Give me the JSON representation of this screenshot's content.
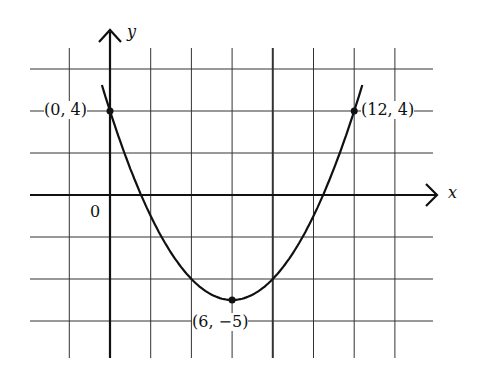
{
  "chart_data": {
    "type": "line",
    "title": "",
    "xlabel": "x",
    "ylabel": "y",
    "origin_label": "0",
    "function": "y = (1/4)(x - 6)^2 - 5",
    "grid": true,
    "grid_step": 2,
    "xlim": [
      -4,
      16
    ],
    "ylim": [
      -8,
      8
    ],
    "points": [
      {
        "x": 0,
        "y": 4,
        "label": "(0, 4)"
      },
      {
        "x": 12,
        "y": 4,
        "label": "(12, 4)"
      },
      {
        "x": 6,
        "y": -5,
        "label": "(6, −5)"
      }
    ],
    "series": [
      {
        "name": "parabola",
        "x": [
          -0.4,
          0,
          2,
          4,
          6,
          8,
          10,
          12,
          12.4
        ],
        "y": [
          5.24,
          4,
          -1,
          -4,
          -5,
          -4,
          -1,
          4,
          5.24
        ]
      }
    ]
  }
}
